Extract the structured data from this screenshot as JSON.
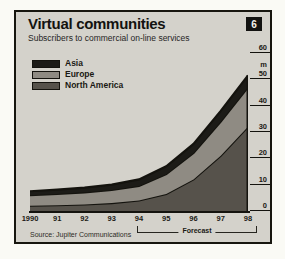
{
  "card": {
    "title": "Virtual communities",
    "subtitle": "Subscribers to commercial on-line services",
    "badge": "6",
    "source": "Source: Jupiter Communications"
  },
  "colors": {
    "card_bg": "#d4d2cb",
    "border": "#17160f",
    "outline": "#14130e",
    "asia": "#1c1b17",
    "europe": "#8f8b83",
    "north_america": "#56524b"
  },
  "legend": {
    "items": [
      {
        "label": "Asia",
        "color": "#1c1b17"
      },
      {
        "label": "Europe",
        "color": "#8f8b83"
      },
      {
        "label": "North America",
        "color": "#56524b"
      }
    ]
  },
  "chart_data": {
    "type": "area",
    "stacked": true,
    "title": "Virtual communities",
    "subtitle": "Subscribers to commercial on-line services",
    "x_labels": [
      "1990",
      "91",
      "92",
      "93",
      "94",
      "95",
      "96",
      "97",
      "98"
    ],
    "series": [
      {
        "name": "North America",
        "color": "#56524b",
        "values": [
          2,
          2.2,
          2.5,
          3,
          4,
          6.5,
          12,
          21,
          32
        ]
      },
      {
        "name": "Europe",
        "color": "#8f8b83",
        "values": [
          4,
          4.3,
          4.6,
          5,
          5.5,
          7.5,
          10,
          13,
          15
        ]
      },
      {
        "name": "Asia",
        "color": "#1c1b17",
        "values": [
          1.5,
          1.6,
          1.8,
          2,
          2.5,
          3,
          3.5,
          4,
          4.5
        ]
      }
    ],
    "stack_totals": [
      7.5,
      8.1,
      8.9,
      10,
      12,
      17,
      25.5,
      38,
      51.5
    ],
    "y_ticks": [
      0,
      10,
      20,
      30,
      40,
      50,
      60
    ],
    "ylim": [
      0,
      60
    ],
    "unit_label": "m",
    "forecast": {
      "label": "Forecast",
      "from": "94",
      "to": "98"
    },
    "legend_position": "top-left",
    "grid": false
  }
}
